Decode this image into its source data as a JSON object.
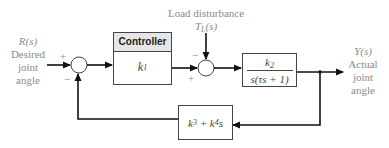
{
  "input": {
    "signal": "R(s)",
    "lines": [
      "Desired",
      "joint",
      "angle"
    ]
  },
  "output": {
    "signal": "Y(s)",
    "lines": [
      "Actual",
      "joint",
      "angle"
    ]
  },
  "disturbance": {
    "label": "Load disturbance",
    "signal_main": "T",
    "signal_sub": "L",
    "signal_arg": "(s)"
  },
  "controller": {
    "title": "Controller",
    "gain_main": "k",
    "gain_sub": "1"
  },
  "plant": {
    "numerator_main": "k",
    "numerator_sub": "2",
    "denominator": "s(τs + 1)"
  },
  "feedback": {
    "term1_main": "k",
    "term1_sub": "3",
    "op": " + ",
    "term2_main": "k",
    "term2_sub": "4",
    "term2_var": "s"
  },
  "junction1": {
    "input_sign": "+",
    "feedback_sign": "−"
  },
  "junction2": {
    "disturbance_sign": "−",
    "control_sign": "+"
  },
  "colors": {
    "line": "#111111",
    "label": "#8a8a8a",
    "box_border": "#444444",
    "header_fill": "#e6e6e6"
  }
}
